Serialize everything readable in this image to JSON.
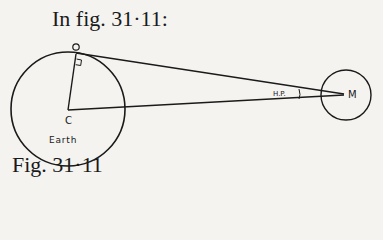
{
  "heading": "In fig. 31·11:",
  "caption": "Fig. 31·11",
  "diagram": {
    "earth_label": "Earth",
    "center_label": "C",
    "observer_label": "O",
    "moon_label": "M",
    "angle_label": "H.P."
  },
  "colors": {
    "ink": "#1a1a1a",
    "paper": "#f4f3f0"
  }
}
